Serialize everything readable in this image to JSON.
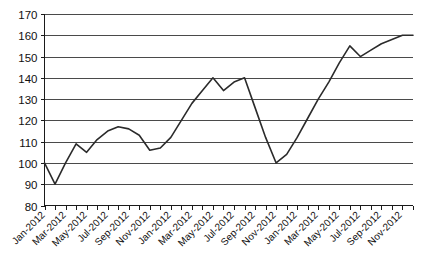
{
  "chart_data": {
    "type": "line",
    "title": "",
    "subtitle": "",
    "xlabel": "",
    "ylabel": "",
    "ylim": [
      80,
      170
    ],
    "ytick_values": [
      80,
      90,
      100,
      110,
      120,
      130,
      140,
      150,
      160,
      170
    ],
    "ytick_labels": [
      "80",
      "90",
      "100",
      "110",
      "120",
      "130",
      "140",
      "150",
      "160",
      "170"
    ],
    "grid": true,
    "grid_axis": "y",
    "legend": false,
    "legend_position": "none",
    "line_color": "#2b2b2b",
    "categories": [
      "Jan-2012",
      "Feb-2012",
      "Mar-2012",
      "Apr-2012",
      "May-2012",
      "Jun-2012",
      "Jul-2012",
      "Aug-2012",
      "Sep-2012",
      "Oct-2012",
      "Nov-2012",
      "Dec-2012",
      "Jan-2012",
      "Feb-2012",
      "Mar-2012",
      "Apr-2012",
      "May-2012",
      "Jun-2012",
      "Jul-2012",
      "Aug-2012",
      "Sep-2012",
      "Oct-2012",
      "Nov-2012",
      "Dec-2012",
      "Jan-2012",
      "Feb-2012",
      "Mar-2012",
      "Apr-2012",
      "May-2012",
      "Jun-2012",
      "Jul-2012",
      "Aug-2012",
      "Sep-2012",
      "Oct-2012",
      "Nov-2012",
      "Dec-2012"
    ],
    "xtick_labels_shown": [
      "Jan-2012",
      "Mar-2012",
      "May-2012",
      "Jul-2012",
      "Sep-2012",
      "Nov-2012",
      "Jan-2012",
      "Mar-2012",
      "May-2012",
      "Jul-2012",
      "Sep-2012",
      "Nov-2012",
      "Jan-2012",
      "Mar-2012",
      "May-2012",
      "Jul-2012",
      "Sep-2012",
      "Nov-2012"
    ],
    "xtick_label_interval": 2,
    "values": [
      100,
      90,
      100,
      109,
      105,
      111,
      115,
      117,
      116,
      113,
      106,
      107,
      112,
      120,
      128,
      134,
      140,
      134,
      138,
      140,
      126,
      112,
      100,
      104,
      112,
      121,
      130,
      138,
      147,
      155,
      150,
      153,
      156,
      158,
      160,
      160
    ],
    "series": [
      {
        "name": "Series 1",
        "color": "#2b2b2b",
        "values": [
          100,
          90,
          100,
          109,
          105,
          111,
          115,
          117,
          116,
          113,
          106,
          107,
          112,
          120,
          128,
          134,
          140,
          134,
          138,
          140,
          126,
          112,
          100,
          104,
          112,
          121,
          130,
          138,
          147,
          155,
          150,
          153,
          156,
          158,
          160,
          160
        ]
      }
    ]
  }
}
